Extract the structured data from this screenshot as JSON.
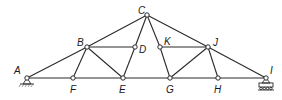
{
  "diagram": {
    "type": "truss",
    "colors": {
      "line": "#2a2a2a",
      "background": "#ffffff"
    },
    "nodes": [
      {
        "id": "A",
        "label": "A",
        "x": 27,
        "y": 78,
        "lx": 14,
        "ly": 74
      },
      {
        "id": "F",
        "label": "F",
        "x": 73,
        "y": 78,
        "lx": 70,
        "ly": 93
      },
      {
        "id": "E",
        "label": "E",
        "x": 123,
        "y": 78,
        "lx": 119,
        "ly": 93
      },
      {
        "id": "G",
        "label": "G",
        "x": 170,
        "y": 78,
        "lx": 166,
        "ly": 93
      },
      {
        "id": "H",
        "label": "H",
        "x": 218,
        "y": 78,
        "lx": 214,
        "ly": 93
      },
      {
        "id": "I",
        "label": "I",
        "x": 266,
        "y": 78,
        "lx": 270,
        "ly": 74
      },
      {
        "id": "B",
        "label": "B",
        "x": 87,
        "y": 47,
        "lx": 77,
        "ly": 46
      },
      {
        "id": "D",
        "label": "D",
        "x": 135,
        "y": 47,
        "lx": 139,
        "ly": 53
      },
      {
        "id": "K",
        "label": "K",
        "x": 160,
        "y": 47,
        "lx": 164,
        "ly": 45
      },
      {
        "id": "J",
        "label": "J",
        "x": 208,
        "y": 47,
        "lx": 213,
        "ly": 46
      },
      {
        "id": "C",
        "label": "C",
        "x": 147,
        "y": 15,
        "lx": 138,
        "ly": 14
      }
    ],
    "members": [
      [
        "A",
        "B"
      ],
      [
        "B",
        "C"
      ],
      [
        "C",
        "J"
      ],
      [
        "J",
        "I"
      ],
      [
        "A",
        "F"
      ],
      [
        "F",
        "E"
      ],
      [
        "E",
        "G"
      ],
      [
        "G",
        "H"
      ],
      [
        "H",
        "I"
      ],
      [
        "B",
        "D"
      ],
      [
        "K",
        "J"
      ],
      [
        "B",
        "F"
      ],
      [
        "B",
        "E"
      ],
      [
        "C",
        "D"
      ],
      [
        "D",
        "E"
      ],
      [
        "C",
        "K"
      ],
      [
        "K",
        "G"
      ],
      [
        "J",
        "G"
      ],
      [
        "J",
        "H"
      ]
    ],
    "supports": [
      {
        "node": "A",
        "type": "pin"
      },
      {
        "node": "I",
        "type": "roller"
      }
    ]
  }
}
